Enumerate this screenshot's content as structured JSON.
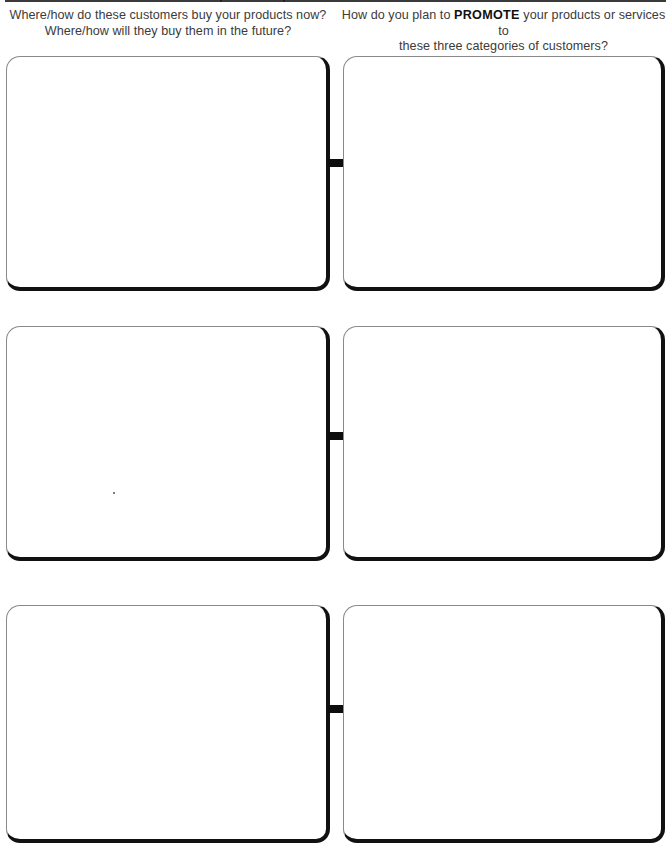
{
  "page": {
    "header_rule": true
  },
  "questions": {
    "left": {
      "line1": "Where/how do these customers buy your products now?",
      "line2": "Where/how will they buy them in the future?"
    },
    "right": {
      "line1_before": "How do you plan to ",
      "line1_emphasis": "PROMOTE",
      "line1_after": " your products or services to",
      "line2": "these three categories of customers?"
    }
  },
  "rows": [
    {
      "left_box": {
        "content": ""
      },
      "right_box": {
        "content": ""
      }
    },
    {
      "left_box": {
        "content": ""
      },
      "right_box": {
        "content": ""
      }
    },
    {
      "left_box": {
        "content": ""
      },
      "right_box": {
        "content": ""
      }
    }
  ],
  "colors": {
    "box_shadow_border": "#111111",
    "box_light_border": "#8a8a8a",
    "text": "#3b3b3b"
  }
}
